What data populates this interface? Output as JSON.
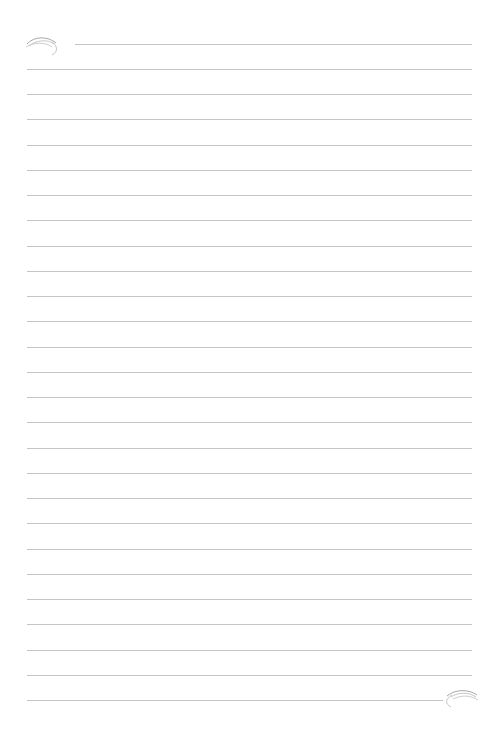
{
  "document": {
    "type": "lined-paper",
    "background_color": "#ffffff",
    "line_color": "#c4c4c4",
    "top_line": {
      "x": 75,
      "y": 44,
      "width": 397
    },
    "lines": {
      "x": 27,
      "first_y": 69,
      "spacing": 25.24,
      "count": 26,
      "width": 445
    },
    "bottom_line_width": 416,
    "ornaments": [
      "top-left-flourish",
      "bottom-right-flourish"
    ]
  }
}
